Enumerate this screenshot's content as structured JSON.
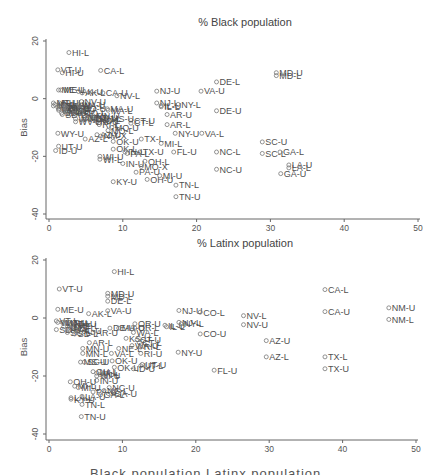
{
  "chart_data": [
    {
      "type": "scatter",
      "title": "% Black population",
      "xlabel": "",
      "ylabel": "Bias",
      "xlim": [
        0,
        50
      ],
      "ylim": [
        -40,
        20
      ],
      "xticks": [
        0,
        10,
        20,
        30,
        40,
        50
      ],
      "yticks": [
        -40,
        -20,
        0,
        20
      ],
      "grid": false,
      "legend": "none",
      "points": [
        {
          "label": "HI-L",
          "x": 2.7,
          "y": 16
        },
        {
          "label": "VT-U",
          "x": 1.2,
          "y": 10
        },
        {
          "label": "HI-U",
          "x": 1.8,
          "y": 9
        },
        {
          "label": "CA-L",
          "x": 7.0,
          "y": 9.8
        },
        {
          "label": "MD-U",
          "x": 30.8,
          "y": 9
        },
        {
          "label": "MD-L",
          "x": 30.8,
          "y": 8
        },
        {
          "label": "DE-L",
          "x": 22.7,
          "y": 5.8
        },
        {
          "label": "NJ-U",
          "x": 14.6,
          "y": 2.6
        },
        {
          "label": "VA-U",
          "x": 20.6,
          "y": 2.6
        },
        {
          "label": "ME-U",
          "x": 1.3,
          "y": 3
        },
        {
          "label": "ME-L",
          "x": 1.6,
          "y": 3
        },
        {
          "label": "AK-U",
          "x": 4.0,
          "y": 2.5
        },
        {
          "label": "AK-L",
          "x": 4.5,
          "y": 2
        },
        {
          "label": "CA-U",
          "x": 7.3,
          "y": 2
        },
        {
          "label": "NV-L",
          "x": 9.2,
          "y": 1
        },
        {
          "label": "NV-U",
          "x": 4.4,
          "y": -1
        },
        {
          "label": "MT-U",
          "x": 0.6,
          "y": -1.5
        },
        {
          "label": "MT-L",
          "x": 0.6,
          "y": -2.5
        },
        {
          "label": "NH-U",
          "x": 1.4,
          "y": -1.5
        },
        {
          "label": "NH-L",
          "x": 1.4,
          "y": -2.5
        },
        {
          "label": "ID-L",
          "x": 0.8,
          "y": -2
        },
        {
          "label": "UT-L",
          "x": 1.2,
          "y": -3
        },
        {
          "label": "WY-L",
          "x": 1.3,
          "y": -3.5
        },
        {
          "label": "VT-L",
          "x": 1.3,
          "y": -4
        },
        {
          "label": "SD-U",
          "x": 1.7,
          "y": -5
        },
        {
          "label": "SD-L",
          "x": 1.8,
          "y": -5.5
        },
        {
          "label": "ND-U",
          "x": 2.0,
          "y": -4
        },
        {
          "label": "ND-L",
          "x": 2.2,
          "y": -4.5
        },
        {
          "label": "OR-U",
          "x": 2.0,
          "y": -3
        },
        {
          "label": "OR-L",
          "x": 2.2,
          "y": -3.5
        },
        {
          "label": "IA-U",
          "x": 3.4,
          "y": -4
        },
        {
          "label": "IA-L",
          "x": 3.4,
          "y": -5
        },
        {
          "label": "NM-U",
          "x": 2.1,
          "y": -2.5
        },
        {
          "label": "NM-L",
          "x": 2.3,
          "y": -3
        },
        {
          "label": "CO-U",
          "x": 4.2,
          "y": -3.5
        },
        {
          "label": "CO-L",
          "x": 4.4,
          "y": -5
        },
        {
          "label": "WA-U",
          "x": 4.0,
          "y": -2
        },
        {
          "label": "WA-L",
          "x": 4.1,
          "y": -2.5
        },
        {
          "label": "MN-U",
          "x": 6.0,
          "y": -6
        },
        {
          "label": "MN-L",
          "x": 6.4,
          "y": -7
        },
        {
          "label": "NE-U",
          "x": 4.8,
          "y": -6.5
        },
        {
          "label": "NE-L",
          "x": 5.0,
          "y": -7
        },
        {
          "label": "KS-U",
          "x": 6.0,
          "y": -6.5
        },
        {
          "label": "KS-L",
          "x": 6.5,
          "y": -7.5
        },
        {
          "label": "RI-U",
          "x": 6.5,
          "y": -8
        },
        {
          "label": "RI-L",
          "x": 6.8,
          "y": -9
        },
        {
          "label": "WV-U",
          "x": 3.6,
          "y": -7
        },
        {
          "label": "WV-L",
          "x": 3.6,
          "y": -8
        },
        {
          "label": "WI-L",
          "x": 6.9,
          "y": -21
        },
        {
          "label": "MA-U",
          "x": 7.9,
          "y": -3.5
        },
        {
          "label": "MA-L",
          "x": 8.0,
          "y": -4
        },
        {
          "label": "NY-U",
          "x": 17.1,
          "y": -12
        },
        {
          "label": "NJ-L",
          "x": 14.6,
          "y": -1.5
        },
        {
          "label": "IL-U",
          "x": 15.2,
          "y": -2.4
        },
        {
          "label": "IL-L",
          "x": 15.2,
          "y": -2.8
        },
        {
          "label": "NY-L",
          "x": 17.5,
          "y": -2
        },
        {
          "label": "DE-U",
          "x": 22.7,
          "y": -4.2
        },
        {
          "label": "AR-U",
          "x": 16.0,
          "y": -5.5
        },
        {
          "label": "AR-L",
          "x": 16.0,
          "y": -9
        },
        {
          "label": "CT-U",
          "x": 11.1,
          "y": -7.5
        },
        {
          "label": "CT-L",
          "x": 11.1,
          "y": -8.5
        },
        {
          "label": "MS-U",
          "x": 8.0,
          "y": -7
        },
        {
          "label": "MO-U",
          "x": 8.5,
          "y": -10
        },
        {
          "label": "MO-L",
          "x": 8.0,
          "y": -11
        },
        {
          "label": "VA-L",
          "x": 20.7,
          "y": -12
        },
        {
          "label": "WY-U",
          "x": 1.2,
          "y": -12
        },
        {
          "label": "AZ-L",
          "x": 4.9,
          "y": -14
        },
        {
          "label": "AZ-U",
          "x": 6.5,
          "y": -12.5
        },
        {
          "label": "NM-X",
          "x": 7.0,
          "y": -13
        },
        {
          "label": "TX-L",
          "x": 12.5,
          "y": -14
        },
        {
          "label": "MI-L",
          "x": 15.2,
          "y": -15.5
        },
        {
          "label": "OK-U",
          "x": 8.7,
          "y": -14.8
        },
        {
          "label": "OK-L",
          "x": 8.7,
          "y": -17.5
        },
        {
          "label": "SC-U",
          "x": 28.9,
          "y": -15
        },
        {
          "label": "SC-L",
          "x": 28.9,
          "y": -19
        },
        {
          "label": "GA-L",
          "x": 31.3,
          "y": -18.5
        },
        {
          "label": "UT-U",
          "x": 1.3,
          "y": -16.5
        },
        {
          "label": "ID-U",
          "x": 0.9,
          "y": -18
        },
        {
          "label": "NC-L",
          "x": 22.7,
          "y": -18.5
        },
        {
          "label": "FL-U",
          "x": 16.9,
          "y": -18.5
        },
        {
          "label": "TX-U",
          "x": 12.3,
          "y": -18.5
        },
        {
          "label": "PA-L",
          "x": 10.6,
          "y": -19
        },
        {
          "label": "IN-L",
          "x": 10.3,
          "y": -18.5
        },
        {
          "label": "WI-U",
          "x": 6.9,
          "y": -20
        },
        {
          "label": "IN-U",
          "x": 10.0,
          "y": -22.5
        },
        {
          "label": "OH-L",
          "x": 13.0,
          "y": -21.7
        },
        {
          "label": "NC-U",
          "x": 22.7,
          "y": -24.5
        },
        {
          "label": "LA-U",
          "x": 32.5,
          "y": -23
        },
        {
          "label": "LA-L",
          "x": 32.5,
          "y": -24
        },
        {
          "label": "GA-U",
          "x": 31.4,
          "y": -26
        },
        {
          "label": "MO-X",
          "x": 12.5,
          "y": -23.5
        },
        {
          "label": "PA-U",
          "x": 11.8,
          "y": -25.5
        },
        {
          "label": "KY-U",
          "x": 8.7,
          "y": -28.8
        },
        {
          "label": "OH-U",
          "x": 13.3,
          "y": -28
        },
        {
          "label": "MI-U",
          "x": 15.0,
          "y": -26.7
        },
        {
          "label": "TN-L",
          "x": 17.2,
          "y": -30
        },
        {
          "label": "TN-U",
          "x": 17.2,
          "y": -34
        }
      ]
    },
    {
      "type": "scatter",
      "title": "% Latinx population",
      "xlabel": "",
      "ylabel": "Bias",
      "xlim": [
        0,
        50
      ],
      "ylim": [
        -40,
        20
      ],
      "xticks": [
        0,
        10,
        20,
        30,
        40,
        50
      ],
      "yticks": [
        -40,
        -20,
        0,
        20
      ],
      "grid": false,
      "legend": "none",
      "points": [
        {
          "label": "HI-L",
          "x": 8.9,
          "y": 16
        },
        {
          "label": "VT-U",
          "x": 1.4,
          "y": 10
        },
        {
          "label": "MD-U",
          "x": 8.0,
          "y": 8.5
        },
        {
          "label": "MD-L",
          "x": 8.0,
          "y": 7.5
        },
        {
          "label": "DE-L",
          "x": 8.0,
          "y": 5.8
        },
        {
          "label": "ME-U",
          "x": 1.2,
          "y": 3
        },
        {
          "label": "AK-L",
          "x": 5.4,
          "y": 1.5
        },
        {
          "label": "VA-U",
          "x": 8.0,
          "y": 2.5
        },
        {
          "label": "NJ-U",
          "x": 17.7,
          "y": 2.6
        },
        {
          "label": "CO-L",
          "x": 20.6,
          "y": 2
        },
        {
          "label": "NV-L",
          "x": 26.5,
          "y": 0.8
        },
        {
          "label": "NV-U",
          "x": 26.5,
          "y": -2.3
        },
        {
          "label": "CA-L",
          "x": 37.6,
          "y": 9.8
        },
        {
          "label": "CA-U",
          "x": 37.6,
          "y": 2.2
        },
        {
          "label": "NM-U",
          "x": 46.3,
          "y": 3.5
        },
        {
          "label": "NM-L",
          "x": 46.3,
          "y": -0.5
        },
        {
          "label": "VT-L",
          "x": 1.0,
          "y": -1
        },
        {
          "label": "WV-U",
          "x": 1.2,
          "y": -1.5
        },
        {
          "label": "MT-U",
          "x": 1.8,
          "y": -1.5
        },
        {
          "label": "MT-L",
          "x": 2.5,
          "y": -2
        },
        {
          "label": "NH-U",
          "x": 3.0,
          "y": -2
        },
        {
          "label": "ME-L",
          "x": 3.5,
          "y": -2.5
        },
        {
          "label": "SD-U",
          "x": 1.0,
          "y": -4
        },
        {
          "label": "ND-U",
          "x": 2.0,
          "y": -3
        },
        {
          "label": "KY-L",
          "x": 2.5,
          "y": -4
        },
        {
          "label": "MS-L",
          "x": 3.0,
          "y": -3.5
        },
        {
          "label": "SC-L",
          "x": 2.5,
          "y": -5
        },
        {
          "label": "SD-L",
          "x": 3.5,
          "y": -5.5
        },
        {
          "label": "AL-U",
          "x": 4.0,
          "y": -4.5
        },
        {
          "label": "AR-U",
          "x": 6.0,
          "y": -5
        },
        {
          "label": "DE-U",
          "x": 8.3,
          "y": -3.5
        },
        {
          "label": "MA-U",
          "x": 9.5,
          "y": -3.5
        },
        {
          "label": "OR-U",
          "x": 11.7,
          "y": -2
        },
        {
          "label": "OR-L",
          "x": 11.7,
          "y": -3.5
        },
        {
          "label": "IL-U",
          "x": 15.8,
          "y": -2.5
        },
        {
          "label": "IL-L",
          "x": 16.0,
          "y": -3
        },
        {
          "label": "NJ-L",
          "x": 17.7,
          "y": -1.5
        },
        {
          "label": "NY-L",
          "x": 18.0,
          "y": -2
        },
        {
          "label": "CO-U",
          "x": 20.6,
          "y": -5.5
        },
        {
          "label": "KS-U",
          "x": 10.5,
          "y": -7
        },
        {
          "label": "CT-U",
          "x": 12.0,
          "y": -7.5
        },
        {
          "label": "CT-L",
          "x": 12.3,
          "y": -8.5
        },
        {
          "label": "WA-L",
          "x": 11.5,
          "y": -5
        },
        {
          "label": "AZ-U",
          "x": 29.6,
          "y": -7.8
        },
        {
          "label": "AR-L",
          "x": 5.5,
          "y": -8.5
        },
        {
          "label": "MN-U",
          "x": 4.6,
          "y": -10.5
        },
        {
          "label": "MN-L",
          "x": 4.6,
          "y": -12.2
        },
        {
          "label": "NE-L",
          "x": 9.5,
          "y": -10.5
        },
        {
          "label": "WA-U",
          "x": 11.3,
          "y": -9.5
        },
        {
          "label": "RI-L",
          "x": 12.5,
          "y": -10
        },
        {
          "label": "VA-L",
          "x": 8.5,
          "y": -12.2
        },
        {
          "label": "RI-U",
          "x": 12.5,
          "y": -12.2
        },
        {
          "label": "NY-U",
          "x": 17.6,
          "y": -11.8
        },
        {
          "label": "AZ-L",
          "x": 29.6,
          "y": -13.4
        },
        {
          "label": "TX-L",
          "x": 37.6,
          "y": -13.4
        },
        {
          "label": "TX-U",
          "x": 37.6,
          "y": -17.5
        },
        {
          "label": "MS-U",
          "x": 4.3,
          "y": -15.2
        },
        {
          "label": "SC-U",
          "x": 4.8,
          "y": -15.2
        },
        {
          "label": "OK-U",
          "x": 8.6,
          "y": -14.8
        },
        {
          "label": "OK-L",
          "x": 8.9,
          "y": -17
        },
        {
          "label": "UT-U",
          "x": 12.7,
          "y": -16
        },
        {
          "label": "UT-L",
          "x": 12.5,
          "y": -16.5
        },
        {
          "label": "ID-U",
          "x": 11.5,
          "y": -17.5
        },
        {
          "label": "FL-U",
          "x": 22.5,
          "y": -18
        },
        {
          "label": "OH-L",
          "x": 6.0,
          "y": -18.5
        },
        {
          "label": "WI-L",
          "x": 6.5,
          "y": -19
        },
        {
          "label": "WI-U",
          "x": 6.5,
          "y": -20
        },
        {
          "label": "IN-L",
          "x": 7.0,
          "y": -19.5
        },
        {
          "label": "IN-U",
          "x": 6.5,
          "y": -21.5
        },
        {
          "label": "OH-U",
          "x": 2.9,
          "y": -22
        },
        {
          "label": "MI-L",
          "x": 3.5,
          "y": -23.5
        },
        {
          "label": "MI-U",
          "x": 4.0,
          "y": -24
        },
        {
          "label": "NC-U",
          "x": 8.2,
          "y": -24
        },
        {
          "label": "NC-L",
          "x": 7.5,
          "y": -25
        },
        {
          "label": "PA-U",
          "x": 6.0,
          "y": -25.5
        },
        {
          "label": "GA-U",
          "x": 8.5,
          "y": -26
        },
        {
          "label": "GA-L",
          "x": 7.0,
          "y": -26.5
        },
        {
          "label": "LA-U",
          "x": 4.5,
          "y": -27
        },
        {
          "label": "LA-L",
          "x": 3.0,
          "y": -27.5
        },
        {
          "label": "KY-U",
          "x": 3.0,
          "y": -28
        },
        {
          "label": "TN-L",
          "x": 4.5,
          "y": -29.8
        },
        {
          "label": "TN-U",
          "x": 4.4,
          "y": -34
        }
      ]
    }
  ],
  "panels": [
    {
      "title": "% Black population",
      "ylabel": "Bias",
      "xticks": [
        "0",
        "10",
        "20",
        "30",
        "40",
        "50"
      ],
      "yticks": [
        "20",
        "0",
        "-20",
        "-40"
      ]
    },
    {
      "title": "% Latinx population",
      "ylabel": "Bias",
      "xticks": [
        "0",
        "10",
        "20",
        "30",
        "40",
        "50"
      ],
      "yticks": [
        "20",
        "0",
        "-20",
        "-40"
      ]
    }
  ],
  "caption": "Black population    Latinx population"
}
